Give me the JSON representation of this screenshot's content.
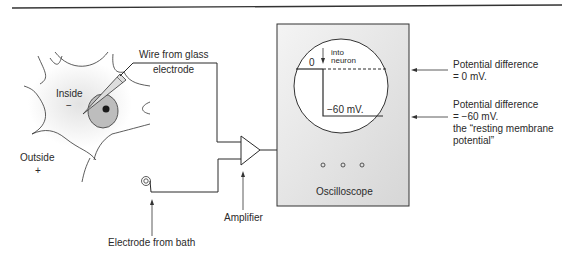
{
  "diagram": {
    "neuron": {
      "inside_label": "Inside",
      "inside_sign": "−",
      "outside_label": "Outside",
      "outside_sign": "+"
    },
    "wire_label_line1": "Wire from glass",
    "wire_label_line2": "electrode",
    "bath_label": "Electrode from bath",
    "amplifier_label": "Amplifier",
    "oscilloscope": {
      "label": "Oscilloscope",
      "zero_label": "0",
      "into_label": "into",
      "neuron_label": "neuron",
      "trace_value_label": "−60 mV.",
      "knobs": 3
    },
    "annotations": [
      {
        "line1": "Potential difference",
        "line2": "= 0 mV."
      },
      {
        "line1": "Potential difference",
        "line2": "= −60 mV.",
        "line3": "the “resting membrane",
        "line4": "potential”"
      }
    ],
    "colors": {
      "line": "#2a2a2a",
      "box_fill": "#e6e6e6",
      "soma_fill": "#bdbdbd",
      "nucleus": "#1a1a1a"
    }
  }
}
